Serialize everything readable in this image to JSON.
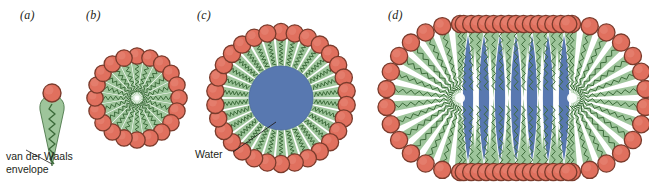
{
  "figure": {
    "background_color": "#ffffff",
    "width": 649,
    "height": 196
  },
  "colors": {
    "head_fill": "#e0705e",
    "head_fill_light": "#e8897a",
    "head_stroke": "#7a3b2c",
    "tail_wedge": "#9ec59b",
    "tail_wedge_light": "#b8d6b3",
    "tail_chain": "#3c6b3a",
    "water_fill": "#5878b0",
    "water_stroke": "#4a68a0",
    "text": "#231f20",
    "leader_line": "#231f20"
  },
  "panels": [
    {
      "id": "a",
      "label": "(a)",
      "name": "single-surfactant-molecule",
      "description": "single amphiphile molecule with van der Waals envelope",
      "head_count": 1,
      "caption": {
        "line1": "van der Waals",
        "line2": "envelope",
        "has_leader_line": true
      }
    },
    {
      "id": "b",
      "label": "(b)",
      "name": "spherical-micelle",
      "description": "spherical micelle, tails meeting at the center",
      "head_count": 20,
      "core": "none",
      "radius": 45
    },
    {
      "id": "c",
      "label": "(c)",
      "name": "reverse-micelle-with-water-core",
      "description": "micelle with a water core",
      "head_count": 30,
      "core": "water",
      "radius": 72,
      "core_radius": 32,
      "callout": {
        "text": "Water",
        "has_leader_line": true
      }
    },
    {
      "id": "d",
      "label": "(d)",
      "name": "rod-like-elongated-micelle",
      "description": "elongated rod-like micelle with water lenses in the core",
      "head_count": 48,
      "core": "water",
      "water_lens_count": 7,
      "length": 245,
      "height": 168
    }
  ]
}
